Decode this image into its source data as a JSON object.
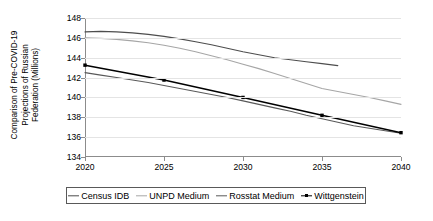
{
  "chart_data": {
    "type": "line",
    "title": "",
    "ylabel": "Comparison of Pre-COVID-19 Projections of Russian Federation (Millions)",
    "ylabel_lines": [
      "Comparison of Pre-COVID-19",
      "Projections of Russian",
      "Federation (Millions)"
    ],
    "xlabel": "",
    "xlim": [
      2020,
      2040
    ],
    "ylim": [
      134,
      148
    ],
    "xticks": [
      "2020",
      "2025",
      "2030",
      "2035",
      "2040"
    ],
    "yticks": [
      "148",
      "146",
      "144",
      "142",
      "140",
      "138",
      "136",
      "134"
    ],
    "grid": true,
    "legend_position": "bottom",
    "series": [
      {
        "name": "Census IDB",
        "color": "#4d4d4d",
        "marker": "none",
        "x": [
          2020,
          2021,
          2022,
          2023,
          2024,
          2025,
          2026,
          2027,
          2028,
          2029,
          2030,
          2031,
          2032,
          2033,
          2034,
          2035,
          2036
        ],
        "values": [
          146.6,
          146.65,
          146.6,
          146.5,
          146.35,
          146.15,
          145.9,
          145.6,
          145.3,
          144.95,
          144.6,
          144.3,
          144.0,
          143.8,
          143.6,
          143.4,
          143.2
        ]
      },
      {
        "name": "UNPD Medium",
        "color": "#a6a6a6",
        "marker": "none",
        "x": [
          2020,
          2021,
          2022,
          2023,
          2024,
          2025,
          2026,
          2027,
          2028,
          2029,
          2030,
          2031,
          2032,
          2033,
          2034,
          2035,
          2036,
          2037,
          2038,
          2039,
          2040
        ],
        "values": [
          146.0,
          145.95,
          145.85,
          145.7,
          145.5,
          145.25,
          144.95,
          144.6,
          144.2,
          143.8,
          143.35,
          142.9,
          142.4,
          141.9,
          141.4,
          140.9,
          140.6,
          140.3,
          140.0,
          139.65,
          139.3
        ]
      },
      {
        "name": "Rosstat Medium",
        "color": "#595959",
        "marker": "none",
        "x": [
          2020,
          2021,
          2022,
          2023,
          2024,
          2025,
          2026,
          2027,
          2028,
          2029,
          2030,
          2031,
          2032,
          2033,
          2034,
          2035,
          2036,
          2037,
          2038,
          2039,
          2040
        ],
        "values": [
          142.5,
          142.25,
          142.0,
          141.75,
          141.5,
          141.2,
          140.9,
          140.6,
          140.3,
          140.0,
          139.65,
          139.3,
          138.95,
          138.6,
          138.2,
          137.85,
          137.5,
          137.15,
          136.9,
          136.65,
          136.4
        ]
      },
      {
        "name": "Wittgenstein",
        "color": "#000000",
        "marker": "square",
        "x": [
          2020,
          2025,
          2030,
          2035,
          2040
        ],
        "values": [
          143.25,
          141.75,
          140.0,
          138.2,
          136.45
        ]
      }
    ]
  },
  "legend": {
    "items": [
      {
        "label": "Census IDB",
        "color": "#4d4d4d",
        "marker": "none"
      },
      {
        "label": "UNPD Medium",
        "color": "#a6a6a6",
        "marker": "none"
      },
      {
        "label": "Rosstat Medium",
        "color": "#595959",
        "marker": "none"
      },
      {
        "label": "Wittgenstein",
        "color": "#000000",
        "marker": "square"
      }
    ]
  }
}
